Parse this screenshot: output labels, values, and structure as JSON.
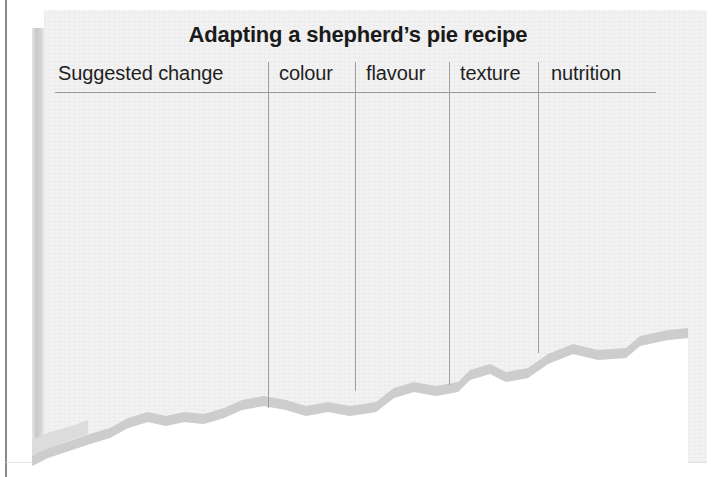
{
  "document": {
    "title": "Adapting a shepherd’s pie recipe",
    "table": {
      "columns": [
        {
          "label": "Suggested change"
        },
        {
          "label": "colour"
        },
        {
          "label": "flavour"
        },
        {
          "label": "texture"
        },
        {
          "label": "nutrition"
        }
      ],
      "rows": []
    }
  },
  "colors": {
    "paper": "#f2f2f2",
    "ink": "#1a1a1a",
    "rule": "#9a9a9a",
    "page_shadow": "#cdcdcd",
    "scan_border": "#8a8a8a"
  }
}
